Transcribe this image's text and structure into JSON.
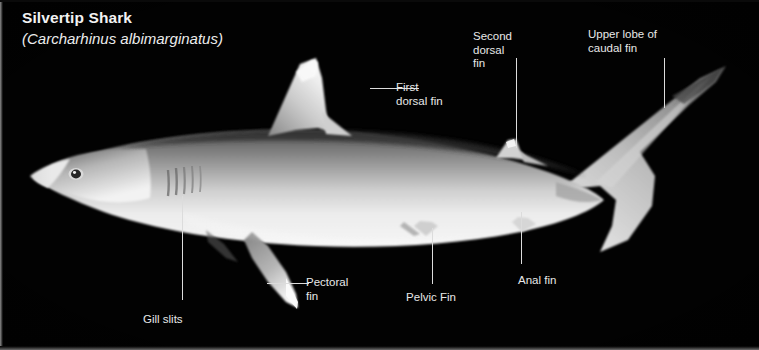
{
  "figure": {
    "kind": "labeled-anatomy-diagram",
    "subject": "shark",
    "background_color": "#000000",
    "text_color": "#e8e8e8",
    "leader_line_color": "#dcdcdc"
  },
  "title": {
    "common_name": "Silvertip Shark",
    "scientific_name": "(Carcharhinus albimarginatus)"
  },
  "labels": [
    {
      "id": "first-dorsal-fin",
      "line1": "First",
      "line2": "dorsal fin",
      "line3": ""
    },
    {
      "id": "second-dorsal-fin",
      "line1": "Second",
      "line2": "dorsal",
      "line3": "fin"
    },
    {
      "id": "upper-lobe-caudal-fin",
      "line1": "Upper lobe of",
      "line2": "caudal fin",
      "line3": ""
    },
    {
      "id": "gill-slits",
      "line1": "Gill slits",
      "line2": "",
      "line3": ""
    },
    {
      "id": "pectoral-fin",
      "line1": "Pectoral",
      "line2": "fin",
      "line3": ""
    },
    {
      "id": "pelvic-fin",
      "line1": "Pelvic Fin",
      "line2": "",
      "line3": ""
    },
    {
      "id": "anal-fin",
      "line1": "Anal fin",
      "line2": "",
      "line3": ""
    }
  ]
}
